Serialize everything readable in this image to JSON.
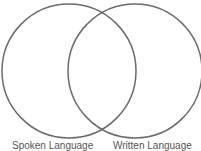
{
  "diagram": {
    "type": "venn",
    "stroke_color": "#6b6b6b",
    "sets": [
      {
        "label": "Spoken Language"
      },
      {
        "label": "Written Language"
      }
    ]
  }
}
